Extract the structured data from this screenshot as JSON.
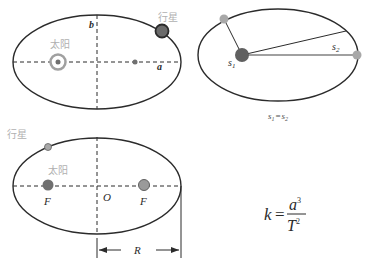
{
  "diagrams": {
    "first_law": {
      "sun_label": "太阳",
      "planet_label": "行星",
      "semi_minor_label": "b",
      "semi_major_label": "a"
    },
    "second_law": {
      "area1_label": "s",
      "area1_sub": "1",
      "area2_label": "s",
      "area2_sub": "2",
      "equation_left": "s",
      "equation_left_sub": "1",
      "equation_eq": "=",
      "equation_right": "s",
      "equation_right_sub": "2"
    },
    "third_law": {
      "planet_label": "行星",
      "sun_label": "太阳",
      "focus1_label": "F",
      "focus2_label": "F",
      "center_label": "O",
      "radius_label": "R"
    },
    "formula": {
      "lhs": "k",
      "eq": "=",
      "numerator_base": "a",
      "numerator_exp": "3",
      "denominator_base": "T",
      "denominator_exp": "2"
    }
  },
  "colors": {
    "stroke": "#2b2b2b",
    "planet_dark": "#6b6b6b",
    "planet_light": "#a8a8a8",
    "sun_ring": "#a0a0a0",
    "label_gray": "#b0b0b0",
    "sun_dark": "#606060"
  }
}
